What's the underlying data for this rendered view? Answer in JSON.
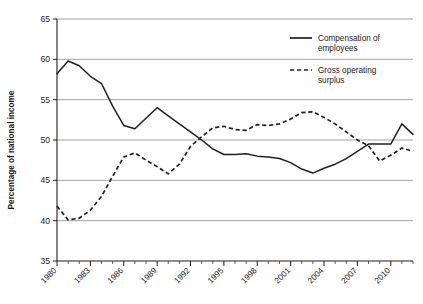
{
  "chart_data": {
    "type": "line",
    "title": "",
    "xlabel": "",
    "ylabel": "Percentage of national income",
    "ylim": [
      35,
      65
    ],
    "ytick_step": 5,
    "yticks": [
      35,
      40,
      45,
      50,
      55,
      60,
      65
    ],
    "xlim": [
      1980,
      2012
    ],
    "xticks": [
      1980,
      1983,
      1986,
      1989,
      1992,
      1995,
      1998,
      2001,
      2004,
      2007,
      2010
    ],
    "xtick_labels": [
      "1980",
      "1983",
      "1986",
      "1989",
      "1992",
      "1995",
      "1998",
      "2001",
      "2004",
      "2007",
      "2010"
    ],
    "x": [
      1980,
      1981,
      1982,
      1983,
      1984,
      1985,
      1986,
      1987,
      1988,
      1989,
      1990,
      1991,
      1992,
      1993,
      1994,
      1995,
      1996,
      1997,
      1998,
      1999,
      2000,
      2001,
      2002,
      2003,
      2004,
      2005,
      2006,
      2007,
      2008,
      2009,
      2010,
      2011,
      2012
    ],
    "grid": true,
    "grid_axis": "y",
    "legend_position": "top-right",
    "series": [
      {
        "name": "Compensation of employees",
        "style": "solid",
        "color": "#231f20",
        "values": [
          58.2,
          59.8,
          59.2,
          57.9,
          57.0,
          54.2,
          51.8,
          51.4,
          52.7,
          54.0,
          53.0,
          52.0,
          51.0,
          50.0,
          48.9,
          48.2,
          48.2,
          48.3,
          48.0,
          47.9,
          47.7,
          47.2,
          46.4,
          45.9,
          46.5,
          47.0,
          47.7,
          48.6,
          49.5,
          49.5,
          49.5,
          52.0,
          50.7
        ]
      },
      {
        "name": "Gross operating surplus",
        "style": "dashed",
        "color": "#231f20",
        "values": [
          41.8,
          40.1,
          40.3,
          41.3,
          43.0,
          45.5,
          47.9,
          48.4,
          47.5,
          46.7,
          45.8,
          47.0,
          49.2,
          50.4,
          51.5,
          51.7,
          51.3,
          51.2,
          51.9,
          51.8,
          52.0,
          52.6,
          53.4,
          53.5,
          52.8,
          52.0,
          51.0,
          50.0,
          49.3,
          47.4,
          48.1,
          49.0,
          48.6
        ]
      }
    ],
    "legend": [
      {
        "label_line1": "Compensation of",
        "label_line2": "employees",
        "style": "solid"
      },
      {
        "label_line1": "Gross operating",
        "label_line2": "surplus",
        "style": "dashed"
      }
    ]
  },
  "colors": {
    "line": "#231f20",
    "grid": "#8c8c8c",
    "axis": "#231f20",
    "text": "#1a1a1a",
    "background": "#ffffff"
  }
}
